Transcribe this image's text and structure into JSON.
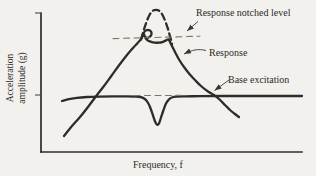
{
  "figure": {
    "background_color": "#f2f1ed",
    "ink_color": "#2e2c29",
    "dashed_guide_color": "#7b776f"
  },
  "chart_data": {
    "type": "line",
    "title": "",
    "xlabel": "Frequency, f",
    "ylabel": "Acceleration amplitude (g)",
    "ylabel_lines": [
      "Acceleration",
      "amplitude (g)"
    ],
    "axes": {
      "grid": false,
      "x_ticks": [],
      "y_ticks": [],
      "y_tick_marks_px": [
        13,
        95
      ],
      "note": "Axes are qualitative (no numeric scale). Two unlabeled tick marks on y-axis: top of axis and the base-excitation level.",
      "coordinate_space": "SVG pixels, 316x176, y increases downward"
    },
    "series": [
      {
        "name": "response",
        "label": "Response",
        "style": "solid-bold",
        "smooth": true,
        "points_px": [
          [
            64,
            136
          ],
          [
            72,
            126
          ],
          [
            80,
            117
          ],
          [
            88,
            107
          ],
          [
            97,
            95
          ],
          [
            104,
            86
          ],
          [
            112,
            75
          ],
          [
            120,
            64
          ],
          [
            127,
            55
          ],
          [
            133,
            48
          ],
          [
            138,
            42.5
          ],
          [
            141.5,
            38.5
          ],
          [
            143,
            34.5
          ],
          [
            145,
            31
          ],
          [
            148,
            29.8
          ],
          [
            150.8,
            31.3
          ],
          [
            151.5,
            34
          ],
          [
            150,
            36.6
          ],
          [
            147.4,
            37.8
          ],
          [
            145,
            36.8
          ],
          [
            144.2,
            34.6
          ],
          [
            145.4,
            37.8
          ],
          [
            147.6,
            40.3
          ],
          [
            151,
            41.8
          ],
          [
            155,
            42.6
          ],
          [
            159,
            42.7
          ],
          [
            163,
            41.8
          ],
          [
            166,
            40.4
          ],
          [
            168.3,
            39.4
          ],
          [
            170,
            42
          ],
          [
            172.5,
            47
          ],
          [
            175.5,
            53
          ],
          [
            179,
            59.5
          ],
          [
            184,
            67
          ],
          [
            189,
            73.5
          ],
          [
            195,
            80
          ],
          [
            201,
            86
          ],
          [
            208,
            91.5
          ],
          [
            214,
            95
          ],
          [
            219,
            99
          ],
          [
            225,
            105
          ],
          [
            230,
            110
          ],
          [
            235,
            114
          ],
          [
            239,
            117
          ]
        ]
      },
      {
        "name": "response-unnotched-peak",
        "label": "Un-notched resonance peak (dashed)",
        "style": "dashed-bold",
        "smooth": true,
        "points_px": [
          [
            141,
            39.5
          ],
          [
            143.5,
            31
          ],
          [
            146.5,
            22
          ],
          [
            149.5,
            15
          ],
          [
            152.5,
            11
          ],
          [
            156,
            9.8
          ],
          [
            159.5,
            11
          ],
          [
            162.5,
            15
          ],
          [
            165,
            20.5
          ],
          [
            167.5,
            27.5
          ],
          [
            169.5,
            34.5
          ],
          [
            171.3,
            41
          ],
          [
            172,
            44
          ]
        ]
      },
      {
        "name": "notched-level-line",
        "label": "Response notched level (dashed guide)",
        "style": "dashed-thin",
        "smooth": false,
        "points_px": [
          [
            113,
            38.6
          ],
          [
            200,
            36.2
          ]
        ]
      },
      {
        "name": "base-excitation",
        "label": "Base excitation",
        "style": "solid-bold",
        "smooth": true,
        "points_px": [
          [
            62,
            101
          ],
          [
            69,
            99.2
          ],
          [
            77,
            97.8
          ],
          [
            87,
            97
          ],
          [
            99,
            96.6
          ],
          [
            113,
            96.4
          ],
          [
            127,
            96.4
          ],
          [
            136,
            96.6
          ],
          [
            141,
            97.2
          ],
          [
            144.5,
            98.8
          ],
          [
            147.5,
            102
          ],
          [
            150,
            107
          ],
          [
            152.5,
            114
          ],
          [
            154.5,
            120
          ],
          [
            156,
            123.5
          ],
          [
            157.6,
            124.8
          ],
          [
            159.2,
            123
          ],
          [
            161,
            117.5
          ],
          [
            163.5,
            110
          ],
          [
            166,
            103.5
          ],
          [
            169,
            99.3
          ],
          [
            172.5,
            97.3
          ],
          [
            177,
            96.6
          ],
          [
            186,
            96.3
          ],
          [
            200,
            96.2
          ],
          [
            230,
            96
          ],
          [
            265,
            96
          ],
          [
            302,
            96
          ]
        ]
      },
      {
        "name": "notch-bridge-line",
        "label": "Dashed guide across base-excitation notch",
        "style": "dashed-thin",
        "smooth": false,
        "points_px": [
          [
            134,
            95.6
          ],
          [
            181,
            95.4
          ]
        ]
      }
    ],
    "annotations": [
      {
        "text": "Response notched level",
        "points_to": "thin dashed level line",
        "arrow_from_px": [
          198,
          21.5
        ],
        "arrow_to_px": [
          187,
          31
        ]
      },
      {
        "text": "Response",
        "points_to": "descending solid response curve",
        "arrow_from_px": [
          206,
          50.5
        ],
        "arrow_to_px": [
          184,
          54
        ]
      },
      {
        "text": "Base excitation",
        "points_to": "intersection of response curve and base excitation line",
        "arrow_from_px": [
          229,
          80
        ],
        "arrow_to_px": [
          214.5,
          90.5
        ]
      }
    ]
  }
}
